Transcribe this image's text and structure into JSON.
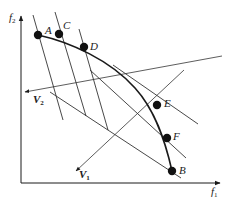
{
  "diagram": {
    "axes": {
      "x_label": "f",
      "x_label_sub": "1",
      "y_label": "f",
      "y_label_sub": "2"
    },
    "vectors": {
      "v1": {
        "label": "V",
        "sub": "1"
      },
      "v2": {
        "label": "V",
        "sub": "2"
      }
    },
    "points": [
      {
        "id": "A",
        "label": "A"
      },
      {
        "id": "C",
        "label": "C"
      },
      {
        "id": "D",
        "label": "D"
      },
      {
        "id": "E",
        "label": "E"
      },
      {
        "id": "F",
        "label": "F"
      },
      {
        "id": "B",
        "label": "B"
      }
    ],
    "colors": {
      "ink": "#1a1a1a",
      "thin_line": "#333333"
    }
  }
}
